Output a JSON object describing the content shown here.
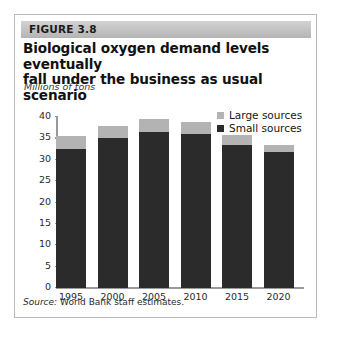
{
  "figure": {
    "header_label": "FIGURE 3.8",
    "title_line1": "Biological oxygen demand levels eventually",
    "title_line2": "fall under the business as usual scenario",
    "source_prefix": "Source:",
    "source_text": "World Bank staff estimates."
  },
  "colors": {
    "large_sources": "#b3b3b3",
    "small_sources": "#2b2b2b",
    "axis": "#9a9a9a",
    "header_band": "#c2c2c2",
    "border": "#b9b9b9"
  },
  "chart_data": {
    "type": "bar",
    "stacked": true,
    "title": "Biological oxygen demand levels eventually fall under the business as usual scenario",
    "subtitle": "",
    "xlabel": "",
    "ylabel": "Millions of tons",
    "ylim": [
      0,
      40
    ],
    "yticks": [
      0,
      5,
      10,
      15,
      20,
      25,
      30,
      35,
      40
    ],
    "ytick_labels": [
      "0",
      "5",
      "10",
      "15",
      "20",
      "25",
      "30",
      "35",
      "40"
    ],
    "grid": false,
    "legend_position": "top-right",
    "categories": [
      "1995",
      "2000",
      "2005",
      "2010",
      "2015",
      "2020"
    ],
    "series": [
      {
        "name": "Small sources",
        "color": "#2b2b2b",
        "values": [
          32.5,
          35.0,
          36.5,
          36.0,
          33.5,
          31.7
        ]
      },
      {
        "name": "Large sources",
        "color": "#b3b3b3",
        "values": [
          3.0,
          3.0,
          3.0,
          2.8,
          2.2,
          1.8
        ]
      }
    ],
    "totals": [
      35.5,
      38.0,
      39.5,
      38.8,
      35.7,
      33.5
    ]
  }
}
